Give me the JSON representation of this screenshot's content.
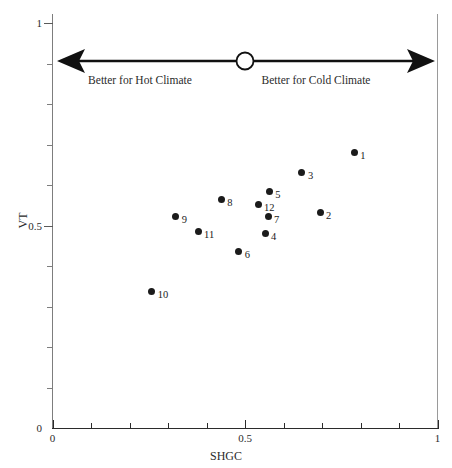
{
  "chart_data": {
    "type": "scatter",
    "title": "",
    "xlabel": "SHGC",
    "ylabel": "VT",
    "xlim": [
      0,
      1
    ],
    "ylim": [
      0,
      1
    ],
    "grid": false,
    "legend": "none",
    "x_ticklabels": [
      "0",
      "0.5",
      "1"
    ],
    "y_ticklabels": [
      "0",
      "0.5",
      "1"
    ],
    "x_tick_values": [
      0,
      0.5,
      1
    ],
    "y_tick_values": [
      0,
      0.5,
      1
    ],
    "x_minor_ticks": [
      0.1,
      0.2,
      0.3,
      0.4,
      0.6,
      0.7,
      0.8,
      0.9
    ],
    "y_minor_ticks": [
      0.1,
      0.2,
      0.3,
      0.4,
      0.6,
      0.7,
      0.8,
      0.9
    ],
    "marker": "filled-circle",
    "marker_color": "#1b1b1b",
    "points": [
      {
        "label": "1",
        "x": 0.784,
        "y": 0.681
      },
      {
        "label": "2",
        "x": 0.695,
        "y": 0.533
      },
      {
        "label": "3",
        "x": 0.648,
        "y": 0.63
      },
      {
        "label": "4",
        "x": 0.552,
        "y": 0.481
      },
      {
        "label": "5",
        "x": 0.563,
        "y": 0.583
      },
      {
        "label": "6",
        "x": 0.484,
        "y": 0.435
      },
      {
        "label": "7",
        "x": 0.56,
        "y": 0.521
      },
      {
        "label": "8",
        "x": 0.438,
        "y": 0.565
      },
      {
        "label": "9",
        "x": 0.32,
        "y": 0.521
      },
      {
        "label": "10",
        "x": 0.258,
        "y": 0.336
      },
      {
        "label": "11",
        "x": 0.378,
        "y": 0.486
      },
      {
        "label": "12",
        "x": 0.534,
        "y": 0.551
      }
    ]
  },
  "annotation": {
    "left_text": "Better for Hot Climate",
    "right_text": "Better for Cold Climate",
    "arrow_style": "double-headed",
    "marker": "open-circle",
    "marker_position": 0.5,
    "color": "#111111"
  }
}
